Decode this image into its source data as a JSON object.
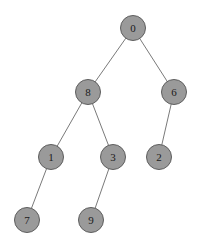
{
  "diagram": {
    "type": "tree",
    "background_color": "#ffffff",
    "node_fill_color": "#9a9a9a",
    "node_border_color": "#5e5e5e",
    "node_label_color": "#1a1a1a",
    "edge_color": "#7a7a7a",
    "node_diameter": 26,
    "node_border_width": 1,
    "edge_width": 1
  },
  "nodes": [
    {
      "id": "0",
      "label": "0",
      "cx": 133,
      "cy": 28,
      "depth": 0
    },
    {
      "id": "8",
      "label": "8",
      "cx": 88,
      "cy": 92,
      "depth": 1
    },
    {
      "id": "6",
      "label": "6",
      "cx": 174,
      "cy": 92,
      "depth": 1
    },
    {
      "id": "1",
      "label": "1",
      "cx": 51,
      "cy": 157,
      "depth": 2
    },
    {
      "id": "3",
      "label": "3",
      "cx": 113,
      "cy": 157,
      "depth": 2
    },
    {
      "id": "2",
      "label": "2",
      "cx": 159,
      "cy": 157,
      "depth": 2
    },
    {
      "id": "7",
      "label": "7",
      "cx": 27,
      "cy": 220,
      "depth": 3
    },
    {
      "id": "9",
      "label": "9",
      "cx": 91,
      "cy": 220,
      "depth": 3
    }
  ],
  "edges": [
    {
      "from": "0",
      "to": "8",
      "side": "left"
    },
    {
      "from": "0",
      "to": "6",
      "side": "right"
    },
    {
      "from": "8",
      "to": "1",
      "side": "left"
    },
    {
      "from": "8",
      "to": "3",
      "side": "right"
    },
    {
      "from": "6",
      "to": "2",
      "side": "left"
    },
    {
      "from": "1",
      "to": "7",
      "side": "left"
    },
    {
      "from": "3",
      "to": "9",
      "side": "left"
    }
  ]
}
